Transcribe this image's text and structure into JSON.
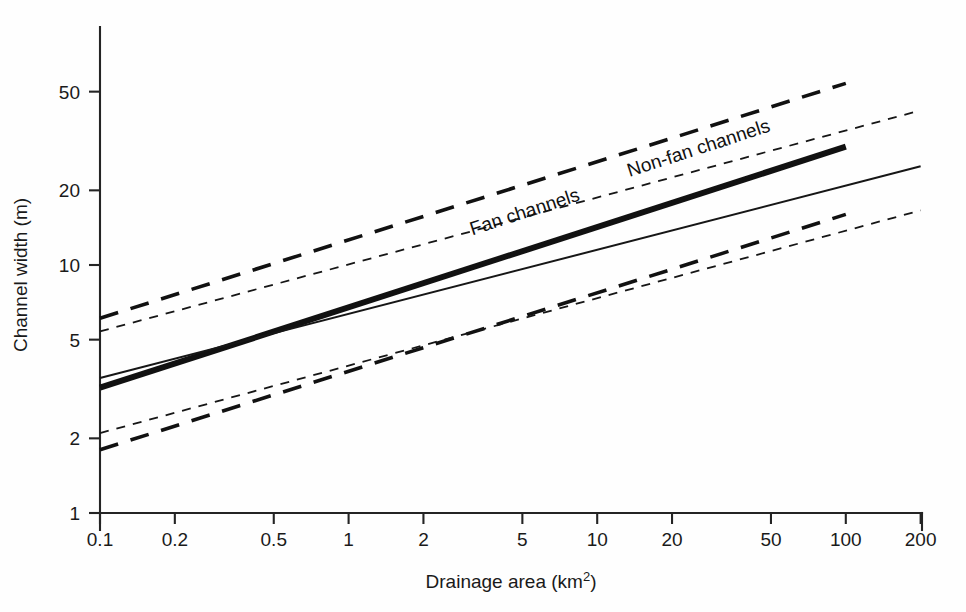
{
  "chart_data": {
    "type": "line",
    "title": "",
    "xlabel": "Drainage area (km",
    "xlabel_sup": "2",
    "xlabel_tail": ")",
    "ylabel": "Channel width (m)",
    "xscale": "log",
    "yscale": "log",
    "xlim": [
      0.1,
      200
    ],
    "ylim": [
      1,
      80
    ],
    "grid": false,
    "legend_position": "inline-annotation",
    "xticks": [
      {
        "value": 0.1,
        "label": "0.1"
      },
      {
        "value": 0.2,
        "label": "0.2"
      },
      {
        "value": 0.5,
        "label": "0.5"
      },
      {
        "value": 1,
        "label": "1"
      },
      {
        "value": 2,
        "label": "2"
      },
      {
        "value": 5,
        "label": "5"
      },
      {
        "value": 10,
        "label": "10"
      },
      {
        "value": 20,
        "label": "20"
      },
      {
        "value": 50,
        "label": "50"
      },
      {
        "value": 100,
        "label": "100"
      },
      {
        "value": 200,
        "label": "200"
      }
    ],
    "yticks": [
      {
        "value": 1,
        "label": "1"
      },
      {
        "value": 2,
        "label": "2"
      },
      {
        "value": 5,
        "label": "5"
      },
      {
        "value": 10,
        "label": "10"
      },
      {
        "value": 20,
        "label": "20"
      },
      {
        "value": 50,
        "label": "50"
      }
    ],
    "series": [
      {
        "name": "Fan channels",
        "style": "thick-solid",
        "color": "#111111",
        "label": "Fan channels",
        "x": [
          0.1,
          100
        ],
        "y": [
          3.2,
          30.0
        ],
        "bands": [
          {
            "name": "Fan channels upper bound",
            "style": "long-dash",
            "x": [
              0.1,
              100
            ],
            "y": [
              6.1,
              54.0
            ]
          },
          {
            "name": "Fan channels lower bound",
            "style": "long-dash",
            "x": [
              0.1,
              100
            ],
            "y": [
              1.8,
              16.0
            ]
          }
        ]
      },
      {
        "name": "Non-fan channels",
        "style": "thin-solid",
        "color": "#161616",
        "label": "Non-fan channels",
        "x": [
          0.1,
          200
        ],
        "y": [
          3.5,
          25.0
        ],
        "bands": [
          {
            "name": "Non-fan channels upper bound",
            "style": "short-dash",
            "x": [
              0.1,
              200
            ],
            "y": [
              5.4,
              42.0
            ]
          },
          {
            "name": "Non-fan channels lower bound",
            "style": "short-dash",
            "x": [
              0.1,
              200
            ],
            "y": [
              2.1,
              16.6
            ]
          }
        ]
      }
    ],
    "annotations": [
      {
        "text": "Fan channels",
        "x": 5.2,
        "y": 15.5,
        "rotation": -18
      },
      {
        "text": "Non-fan channels",
        "x": 26.0,
        "y": 28.0,
        "rotation": -18
      }
    ]
  }
}
